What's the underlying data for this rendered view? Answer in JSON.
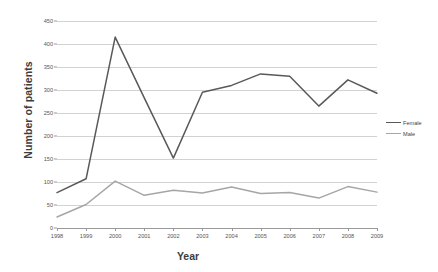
{
  "chart_data": {
    "type": "line",
    "title": "",
    "xlabel": "Year",
    "ylabel": "Number of patients",
    "categories": [
      "1998",
      "1999",
      "2000",
      "2001",
      "2002",
      "2003",
      "2004",
      "2005",
      "2006",
      "2007",
      "2008",
      "2009"
    ],
    "series": [
      {
        "name": "Female",
        "color": "#595959",
        "values": [
          77,
          107,
          415,
          283,
          152,
          295,
          310,
          335,
          330,
          265,
          322,
          293
        ]
      },
      {
        "name": "Male",
        "color": "#a6a6a6",
        "values": [
          24,
          51,
          102,
          71,
          82,
          76,
          89,
          75,
          77,
          65,
          90,
          78
        ]
      }
    ],
    "ylim": [
      0,
      450
    ],
    "ytick_labels": [
      "0",
      "50",
      "100",
      "150",
      "200",
      "250",
      "300",
      "350",
      "400",
      "450"
    ],
    "ytick_values": [
      0,
      50,
      100,
      150,
      200,
      250,
      300,
      350,
      400,
      450
    ],
    "grid": true,
    "legend_position": "right"
  },
  "legend": {
    "entries": [
      {
        "label": "Female"
      },
      {
        "label": "Male"
      }
    ]
  },
  "axes": {
    "y_title": "Number of patients",
    "x_title": "Year"
  }
}
